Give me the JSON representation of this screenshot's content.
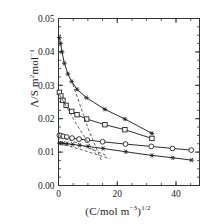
{
  "chart_data": {
    "type": "line",
    "title": "",
    "xlabel": "(C/mol m⁻³)¹ᐟ²",
    "ylabel": "Λ/S m²mol⁻¹",
    "xlim": [
      0,
      48
    ],
    "ylim": [
      0.0,
      0.05
    ],
    "xticks": [
      0,
      20,
      40
    ],
    "xticklabels": [
      "0",
      "20",
      "40"
    ],
    "yticks": [
      0.0,
      0.01,
      0.02,
      0.03,
      0.04,
      0.05
    ],
    "yticklabels": [
      "0.00",
      "0.01",
      "0.02",
      "0.03",
      "0.04",
      "0.05"
    ],
    "xminor_step": 5,
    "yminor_step": 0.0025,
    "grid": false,
    "legend": null,
    "series": [
      {
        "name": "series-1-top-asterisk",
        "marker": "asterisk",
        "linestyle": "solid",
        "color": "#222222",
        "x": [
          0.3,
          0.7,
          1.2,
          2.0,
          3.2,
          4.5,
          6.3,
          9.5,
          15.8,
          22.6,
          31.8
        ],
        "y": [
          0.0443,
          0.0425,
          0.04,
          0.0366,
          0.0334,
          0.0311,
          0.0288,
          0.0263,
          0.0228,
          0.0199,
          0.0156
        ]
      },
      {
        "name": "series-2-square",
        "marker": "square",
        "linestyle": "solid",
        "color": "#222222",
        "x": [
          0.3,
          0.8,
          1.5,
          2.6,
          4.5,
          6.3,
          9.6,
          15.8,
          22.6,
          31.8
        ],
        "y": [
          0.0279,
          0.0268,
          0.0255,
          0.024,
          0.0222,
          0.0212,
          0.0199,
          0.0182,
          0.0167,
          0.0141
        ]
      },
      {
        "name": "series-3-circle",
        "marker": "circle",
        "linestyle": "solid",
        "color": "#222222",
        "x": [
          0.3,
          0.8,
          1.6,
          2.8,
          4.6,
          7.0,
          9.8,
          15.0,
          22.8,
          31.6,
          38.8,
          45.2
        ],
        "y": [
          0.015,
          0.0149,
          0.0147,
          0.0145,
          0.0142,
          0.0139,
          0.0136,
          0.0131,
          0.0124,
          0.0117,
          0.0111,
          0.0106
        ]
      },
      {
        "name": "series-4-bottom-asterisk",
        "marker": "asterisk",
        "linestyle": "solid",
        "color": "#222222",
        "x": [
          0.3,
          0.9,
          1.7,
          2.9,
          4.8,
          7.2,
          10.0,
          15.2,
          22.9,
          31.8,
          38.9,
          45.3
        ],
        "y": [
          0.0127,
          0.0127,
          0.0126,
          0.0125,
          0.0123,
          0.012,
          0.0117,
          0.0111,
          0.0101,
          0.009,
          0.0083,
          0.0076
        ]
      },
      {
        "name": "dashed-limiting-law-1",
        "marker": "none",
        "linestyle": "dashed",
        "color": "#444444",
        "x": [
          4.3,
          10.2,
          14.6
        ],
        "y": [
          0.0318,
          0.0168,
          0.0075
        ]
      },
      {
        "name": "dashed-limiting-law-2",
        "marker": "none",
        "linestyle": "dashed",
        "color": "#444444",
        "x": [
          0.4,
          6.0,
          12.6
        ],
        "y": [
          0.0272,
          0.0185,
          0.0095
        ]
      },
      {
        "name": "dashed-limiting-law-3",
        "marker": "none",
        "linestyle": "dashed",
        "color": "#444444",
        "x": [
          0.4,
          8.0,
          16.0
        ],
        "y": [
          0.0149,
          0.0121,
          0.0091
        ]
      },
      {
        "name": "dashed-limiting-law-4",
        "marker": "none",
        "linestyle": "dashed",
        "color": "#444444",
        "x": [
          0.4,
          9.0,
          17.5
        ],
        "y": [
          0.0126,
          0.0104,
          0.008
        ]
      }
    ]
  },
  "axes": {
    "frame_color": "#333333",
    "background": "#ffffff"
  }
}
